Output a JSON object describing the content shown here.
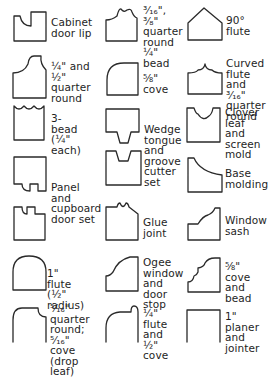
{
  "stroke_color": "#2a2a2a",
  "profiles": [
    {
      "id": "cabinet-door-lip",
      "label": "Cabinet\ndoor lip"
    },
    {
      "id": "quarter-round-bead",
      "label": "³⁄₁₆\", ³⁄₈\"\nquarter\nround\n¼\" bead"
    },
    {
      "id": "90-flute",
      "label": "90°\nflute"
    },
    {
      "id": "quarter-round",
      "label": "¼\" and ½\"\nquarter\nround"
    },
    {
      "id": "five-eighths-cove",
      "label": "⅝\" cove"
    },
    {
      "id": "curved-flute",
      "label": "Curved\nflute\nand ³⁄₁₆\"\nquarter\nround"
    },
    {
      "id": "three-bead",
      "label": "3-bead\n(¼\" each)"
    },
    {
      "id": "wedge-tongue-groove",
      "label": "Wedge\ntongue\nand\ngroove\ncutter\nset"
    },
    {
      "id": "clover-leaf",
      "label": "Clover\nleaf and\nscreen\nmold"
    },
    {
      "id": "panel-cupboard",
      "label": "Panel\nand\ncupboard\ndoor set"
    },
    {
      "id": "base-molding",
      "label": "Base\nmolding"
    },
    {
      "id": "glue-joint",
      "label": "Glue\njoint"
    },
    {
      "id": "window-sash",
      "label": "Window\nsash"
    },
    {
      "id": "one-inch-flute",
      "label": "1\" flute\n(½\" radius)"
    },
    {
      "id": "ogee-window",
      "label": "Ogee\nwindow\nand door\nstop"
    },
    {
      "id": "cove-and-bead",
      "label": "⅝\" cove\nand\nbead"
    },
    {
      "id": "drop-leaf",
      "label": "⁵⁄₁₆\" quarter\nround;\n⁵⁄₁₆\" cove\n(drop leaf)"
    },
    {
      "id": "flute-and-cove",
      "label": "¼\" flute\nand ½\"\ncove"
    },
    {
      "id": "planer-jointer",
      "label": "1\" planer\nand\njointer"
    }
  ]
}
